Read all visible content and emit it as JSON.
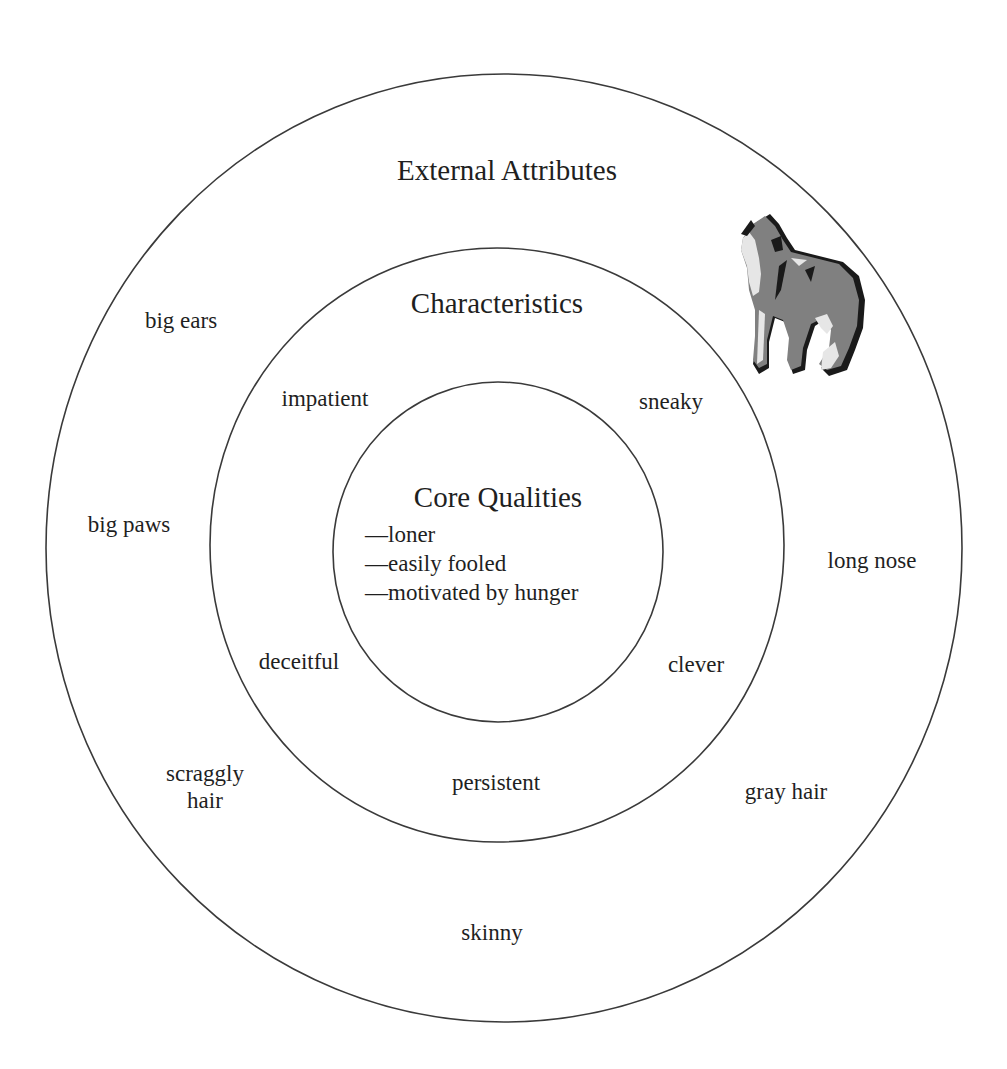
{
  "diagram": {
    "type": "concentric-circles",
    "rings": [
      {
        "id": "external",
        "title": "External Attributes",
        "items": [
          {
            "text": "big ears"
          },
          {
            "text": "big paws"
          },
          {
            "text": "scraggly hair"
          },
          {
            "text": "skinny"
          },
          {
            "text": "gray hair"
          },
          {
            "text": "long nose"
          }
        ]
      },
      {
        "id": "characteristics",
        "title": "Characteristics",
        "items": [
          {
            "text": "impatient"
          },
          {
            "text": "sneaky"
          },
          {
            "text": "deceitful"
          },
          {
            "text": "clever"
          },
          {
            "text": "persistent"
          }
        ]
      },
      {
        "id": "core",
        "title": "Core Qualities",
        "items": [
          {
            "text": "—loner"
          },
          {
            "text": "—easily fooled"
          },
          {
            "text": "—motivated by hunger"
          }
        ]
      }
    ],
    "illustration": {
      "icon": "howling-coyote-icon"
    },
    "colors": {
      "stroke": "#3a3a3a",
      "text": "#1f1f1f",
      "background": "#ffffff",
      "wolf_dark": "#1a1a1a",
      "wolf_mid": "#808080",
      "wolf_light": "#e6e6e6"
    }
  }
}
